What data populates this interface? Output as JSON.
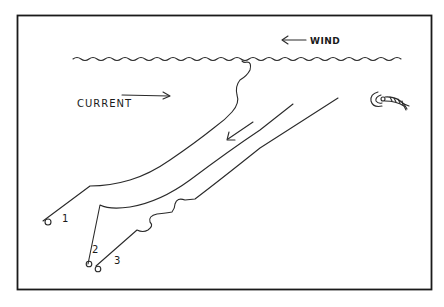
{
  "diagram": {
    "labels": {
      "wind": "WIND",
      "current": "CURRENT",
      "line_1": "1",
      "line_2": "2",
      "line_3": "3"
    },
    "colors": {
      "ink": "#1a1a1a",
      "background": "#ffffff"
    },
    "elements": [
      {
        "id": "water-surface",
        "type": "wavy-line",
        "description": "water surface"
      },
      {
        "id": "wind-arrow",
        "type": "arrow",
        "direction": "left",
        "label": "WIND"
      },
      {
        "id": "current-arrow",
        "type": "arrow",
        "direction": "right",
        "label": "CURRENT"
      },
      {
        "id": "drift-arrow",
        "type": "arrow",
        "direction": "down-left"
      },
      {
        "id": "rod-1",
        "label": "1"
      },
      {
        "id": "rod-2",
        "label": "2"
      },
      {
        "id": "rod-3",
        "label": "3"
      },
      {
        "id": "fish-lure",
        "type": "icon"
      }
    ]
  }
}
